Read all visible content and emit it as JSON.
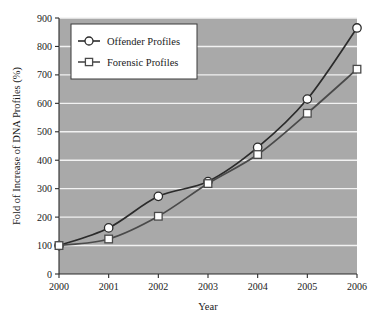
{
  "chart_data": {
    "type": "line",
    "title": "",
    "xlabel": "Year",
    "ylabel": "Fold of Increase of DNA Profiles (%)",
    "categories": [
      "2000",
      "2001",
      "2002",
      "2003",
      "2004",
      "2005",
      "2006"
    ],
    "x": [
      2000,
      2001,
      2002,
      2003,
      2004,
      2005,
      2006
    ],
    "xlim": [
      2000,
      2006
    ],
    "ylim": [
      0,
      900
    ],
    "yticks": [
      0,
      100,
      200,
      300,
      400,
      500,
      600,
      700,
      800,
      900
    ],
    "xticks": [
      "2000",
      "2001",
      "2002",
      "2003",
      "2004",
      "2005",
      "2006"
    ],
    "grid": "horizontal-white",
    "legend_position": "top-left-inside",
    "plot_background": "#a9a9a9",
    "gridline_color": "#f2f2f2",
    "series": [
      {
        "name": "Offender Profiles",
        "marker": "circle",
        "color": "#2b2b2b",
        "marker_fill": "#ffffff",
        "values": [
          100,
          162,
          273,
          325,
          445,
          615,
          865
        ]
      },
      {
        "name": "Forensic Profiles",
        "marker": "square",
        "color": "#4a4a4a",
        "marker_fill": "#ffffff",
        "values": [
          100,
          123,
          203,
          318,
          420,
          565,
          720
        ]
      }
    ]
  },
  "legend": {
    "entries": [
      {
        "label": "Offender Profiles",
        "marker": "circle-marker"
      },
      {
        "label": "Forensic Profiles",
        "marker": "square-marker"
      }
    ]
  },
  "axes": {
    "y_title": "Fold of Increase of DNA Profiles (%)",
    "x_title": "Year",
    "y_tick_labels": [
      "900",
      "800",
      "700",
      "600",
      "500",
      "400",
      "300",
      "200",
      "100",
      "0"
    ],
    "x_tick_labels": [
      "2000",
      "2001",
      "2002",
      "2003",
      "2004",
      "2005",
      "2006"
    ]
  }
}
